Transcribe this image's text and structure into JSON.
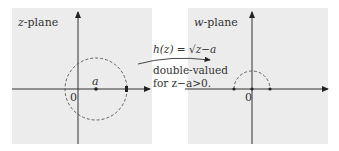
{
  "left_panel": {
    "title_var": "z",
    "title_suffix": "-plane",
    "origin_label": "0",
    "point_label": "a"
  },
  "right_panel": {
    "title_var": "w",
    "title_suffix": "-plane",
    "origin_label": "0"
  },
  "mapping": {
    "formula": "h(z) = √z−a",
    "line1": "double-valued",
    "line2": "for z−a>0."
  },
  "colors": {
    "panel_bg": "#ececec",
    "ink": "#222222",
    "dash": "#555555"
  }
}
